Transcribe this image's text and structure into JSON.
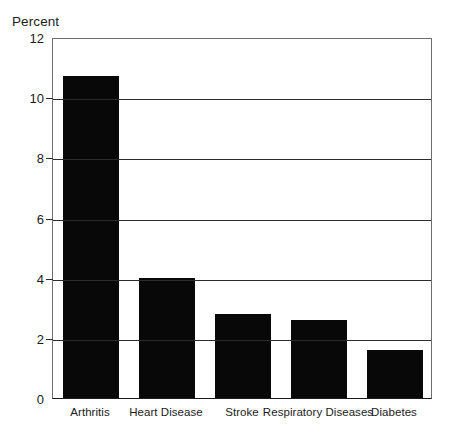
{
  "chart_data": {
    "type": "bar",
    "title": "",
    "subtitle": "",
    "xlabel": "",
    "ylabel": "Percent",
    "categories": [
      "Arthritis",
      "Heart Disease",
      "Stroke",
      "Respiratory Diseases",
      "Diabetes"
    ],
    "values": [
      10.7,
      4.0,
      2.8,
      2.6,
      1.6
    ],
    "series": [
      {
        "name": "Percent",
        "values": [
          10.7,
          4.0,
          2.8,
          2.6,
          1.6
        ]
      }
    ],
    "ylim": [
      0,
      12
    ],
    "yticks": [
      0,
      2,
      4,
      6,
      8,
      10,
      12
    ],
    "ytick_labels": [
      "0",
      "2",
      "4",
      "6",
      "8",
      "10",
      "12"
    ],
    "grid": true,
    "grid_axis": "y",
    "legend": false,
    "legend_position": "none",
    "bar_color": "#080808",
    "axis_color": "#2b2b2b",
    "background_color": "#ffffff"
  }
}
